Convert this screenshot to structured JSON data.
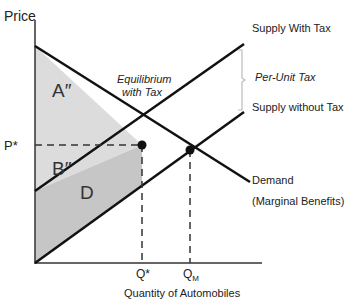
{
  "diagram": {
    "y_axis_label": "Price",
    "x_axis_label": "Quantity of Automobiles",
    "price_label": "P*",
    "q_star_label": "Q*",
    "q_market_label": "Q",
    "q_market_sub": "M",
    "equilibrium_label_line1": "Equilibrium",
    "equilibrium_label_line2": "with Tax",
    "supply_with_tax_label": "Supply With Tax",
    "supply_without_tax_label": "Supply without Tax",
    "per_unit_tax_label": "Per-Unit Tax",
    "demand_label": "Demand",
    "demand_sub_label": "(Marginal Benefits)",
    "regions": {
      "a": "A″",
      "b": "B″",
      "d": "D"
    },
    "colors": {
      "line": "#111111",
      "region_light": "#dcdcdc",
      "region_dark": "#c4c4c4",
      "bracket": "#bbbbbb"
    }
  }
}
